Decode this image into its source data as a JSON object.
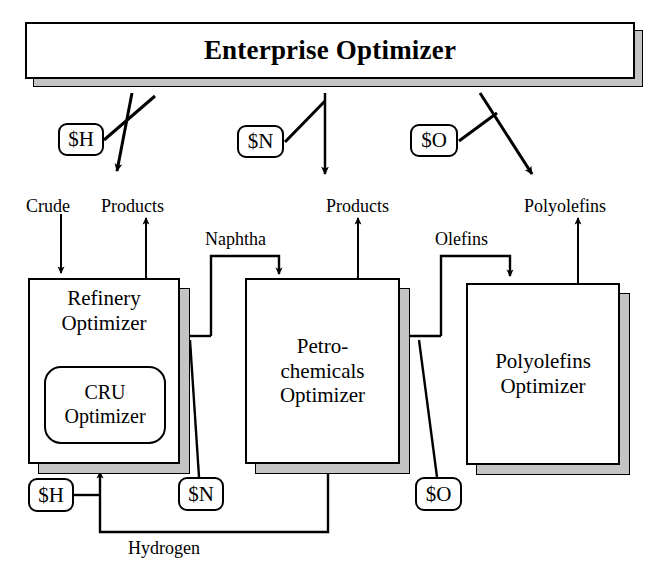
{
  "diagram": {
    "enterprise": {
      "label": "Enterprise Optimizer"
    },
    "units": [
      {
        "id": "refinery",
        "label_line1": "Refinery",
        "label_line2": "Optimizer"
      },
      {
        "id": "petro",
        "label_line1": "Petro-",
        "label_line2": "chemicals",
        "label_line3": "Optimizer"
      },
      {
        "id": "polyolefin",
        "label_line1": "Polyolefins",
        "label_line2": "Optimizer"
      }
    ],
    "sub_unit": {
      "id": "cru",
      "label_line1": "CRU",
      "label_line2": "Optimizer"
    },
    "price_badges": [
      {
        "id": "h-top",
        "label": "$H"
      },
      {
        "id": "n-top",
        "label": "$N"
      },
      {
        "id": "o-top",
        "label": "$O"
      },
      {
        "id": "h-bottom",
        "label": "$H"
      },
      {
        "id": "n-bottom",
        "label": "$N"
      },
      {
        "id": "o-bottom",
        "label": "$O"
      }
    ],
    "stream_labels": [
      {
        "id": "crude",
        "label": "Crude"
      },
      {
        "id": "products-1",
        "label": "Products"
      },
      {
        "id": "naphtha",
        "label": "Naphtha"
      },
      {
        "id": "products-2",
        "label": "Products"
      },
      {
        "id": "olefins",
        "label": "Olefins"
      },
      {
        "id": "polyolefins",
        "label": "Polyolefins"
      },
      {
        "id": "hydrogen",
        "label": "Hydrogen"
      }
    ],
    "colors": {
      "line": "#000000",
      "box_fill": "#ffffff",
      "shadow": "#c4c4c4",
      "background": "#ffffff"
    }
  }
}
